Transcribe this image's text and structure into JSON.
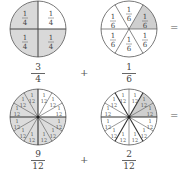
{
  "colors": {
    "shade": "#d6d6d6",
    "line": "#555555",
    "background": "#ffffff"
  },
  "row1": {
    "circle_a": {
      "parts": 4,
      "shaded_parts": 3,
      "sector_label": {
        "num": "1",
        "den": "4"
      }
    },
    "circle_b": {
      "parts": 6,
      "shaded_parts": 1,
      "sector_label": {
        "num": "1",
        "den": "6"
      }
    },
    "frac_a": {
      "num": "3",
      "den": "4"
    },
    "plus": "+",
    "frac_b": {
      "num": "1",
      "den": "6"
    },
    "equals": "="
  },
  "row2": {
    "circle_a": {
      "parts": 12,
      "shaded_parts": 9,
      "sector_label": {
        "num": "1",
        "den": "12"
      }
    },
    "circle_b": {
      "parts": 12,
      "shaded_parts": 2,
      "sector_label": {
        "num": "1",
        "den": "12"
      }
    },
    "frac_a": {
      "num": "9",
      "den": "12"
    },
    "plus": "+",
    "frac_b": {
      "num": "2",
      "den": "12"
    },
    "equals": "="
  }
}
